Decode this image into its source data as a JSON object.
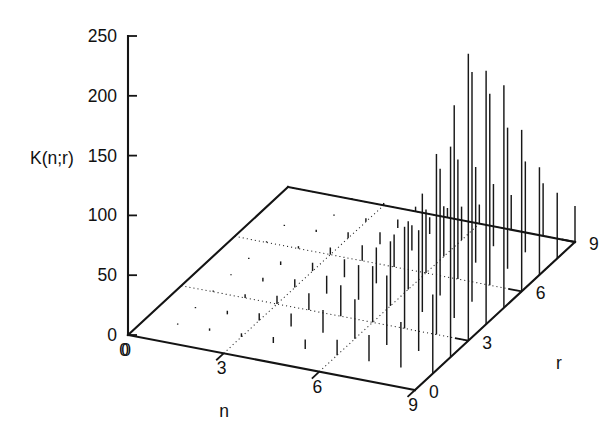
{
  "figure": {
    "kind": "3d-stem-plot",
    "background": "#ffffff",
    "ink_color": "#141414"
  },
  "labels": {
    "zaxis_title": "K(n;r)",
    "xaxis_title": "n",
    "yaxis_title": "r"
  },
  "ticks": {
    "z": [
      "0",
      "50",
      "100",
      "150",
      "200",
      "250"
    ],
    "n": [
      "0",
      "3",
      "6",
      "9"
    ],
    "r": [
      "0",
      "3",
      "6",
      "9"
    ]
  },
  "chart_data": {
    "type": "bar",
    "title": "",
    "subtitle": "",
    "xlabel": "n",
    "ylabel": "r",
    "zlabel": "K(n;r)",
    "projection": "3d-stem",
    "grid": true,
    "legend": "none",
    "xlim": [
      0,
      9
    ],
    "ylim": [
      0,
      9
    ],
    "zlim": [
      0,
      250
    ],
    "xticks": [
      0,
      3,
      6,
      9
    ],
    "yticks": [
      0,
      3,
      6,
      9
    ],
    "zticks": [
      0,
      50,
      100,
      150,
      200,
      250
    ],
    "x": [
      0,
      1,
      2,
      3,
      4,
      5,
      6,
      7,
      8,
      9
    ],
    "y": [
      0,
      1,
      2,
      3,
      4,
      5,
      6,
      7,
      8,
      9
    ],
    "series": [
      {
        "name": "r=0",
        "values": [
          0,
          0,
          0,
          0,
          0,
          0,
          0,
          0,
          0,
          0
        ]
      },
      {
        "name": "r=1",
        "values": [
          0,
          1,
          2,
          3,
          5,
          8,
          13,
          22,
          38,
          66
        ]
      },
      {
        "name": "r=2",
        "values": [
          0,
          1,
          3,
          6,
          11,
          19,
          33,
          58,
          101,
          176
        ]
      },
      {
        "name": "r=3",
        "values": [
          0,
          1,
          3,
          7,
          14,
          26,
          47,
          85,
          151,
          240
        ]
      },
      {
        "name": "r=4",
        "values": [
          0,
          1,
          3,
          7,
          15,
          29,
          54,
          99,
          178,
          212
        ]
      },
      {
        "name": "r=5",
        "values": [
          0,
          1,
          3,
          7,
          15,
          30,
          57,
          106,
          192,
          186
        ]
      },
      {
        "name": "r=6",
        "values": [
          0,
          1,
          2,
          6,
          13,
          27,
          53,
          100,
          160,
          135
        ]
      },
      {
        "name": "r=7",
        "values": [
          0,
          1,
          2,
          5,
          10,
          21,
          42,
          80,
          118,
          90
        ]
      },
      {
        "name": "r=8",
        "values": [
          0,
          0,
          1,
          3,
          7,
          14,
          28,
          52,
          76,
          55
        ]
      },
      {
        "name": "r=9",
        "values": [
          0,
          0,
          1,
          2,
          4,
          8,
          16,
          29,
          44,
          30
        ]
      }
    ]
  },
  "geometry": {
    "origin": {
      "x": 128,
      "y": 335
    },
    "n_end": {
      "x": 415,
      "y": 390
    },
    "r_end": {
      "x": 288,
      "y": 187
    },
    "far_corner": {
      "x": 573,
      "y": 272
    },
    "z_axis_x": 128,
    "z_zero_y": 335,
    "z_top_y": 36
  }
}
